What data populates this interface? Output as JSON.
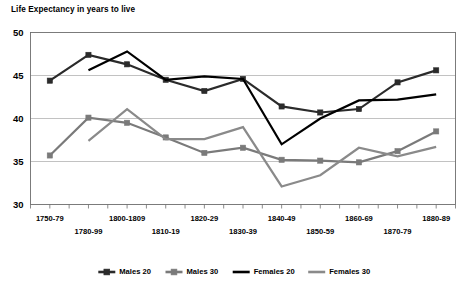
{
  "chart_data": {
    "type": "line",
    "title": "Life Expectancy in years to live",
    "xlabel": "",
    "ylabel": "",
    "ylim": [
      30,
      50
    ],
    "yticks": [
      30,
      35,
      40,
      45,
      50
    ],
    "grid": true,
    "legend_position": "bottom",
    "categories": [
      "1750-79",
      "1780-99",
      "1800-1809",
      "1810-19",
      "1820-29",
      "1830-39",
      "1840-49",
      "1850-59",
      "1860-69",
      "1870-79",
      "1880-89"
    ],
    "series": [
      {
        "name": "Males 20",
        "color": "#2b2b2b",
        "marker": "square",
        "values": [
          44.4,
          47.4,
          46.3,
          44.5,
          43.2,
          44.6,
          41.4,
          40.7,
          41.1,
          44.2,
          45.6
        ]
      },
      {
        "name": "Males 30",
        "color": "#7a7a7a",
        "marker": "square",
        "values": [
          35.7,
          40.1,
          39.5,
          37.8,
          36.0,
          36.6,
          35.2,
          35.1,
          34.9,
          36.2,
          38.5
        ]
      },
      {
        "name": "Females 20",
        "color": "#000000",
        "marker": "none",
        "values": [
          null,
          45.6,
          47.8,
          44.5,
          44.9,
          44.6,
          37.0,
          40.0,
          42.1,
          42.2,
          42.8
        ]
      },
      {
        "name": "Females 30",
        "color": "#8a8a8a",
        "marker": "none",
        "values": [
          null,
          37.4,
          41.1,
          37.6,
          37.6,
          39.0,
          32.1,
          33.4,
          36.6,
          35.6,
          36.7
        ]
      }
    ]
  },
  "legend": {
    "items": [
      {
        "label": "Males 20"
      },
      {
        "label": "Males 30"
      },
      {
        "label": "Females 20"
      },
      {
        "label": "Females 30"
      }
    ]
  }
}
